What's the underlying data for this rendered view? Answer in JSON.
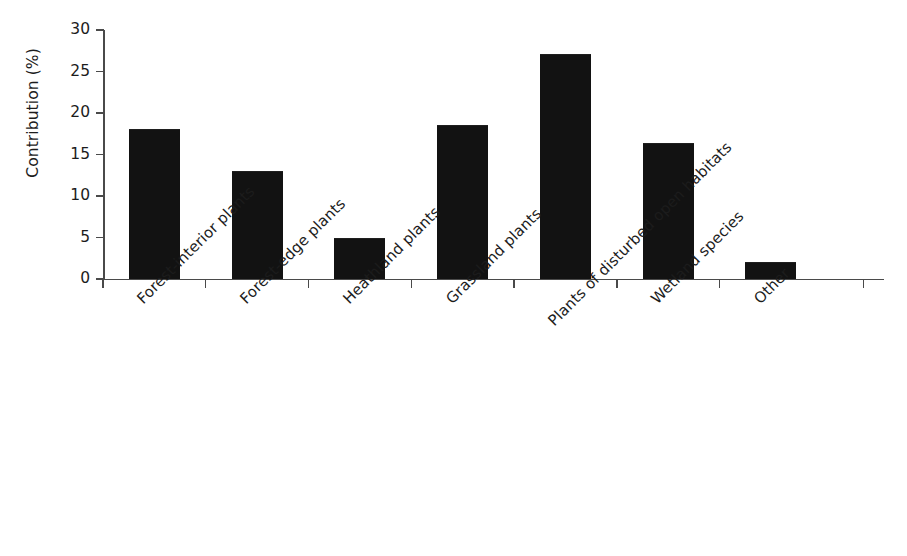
{
  "chart_data": {
    "type": "bar",
    "title": "",
    "xlabel": "",
    "ylabel": "Contribution (%)",
    "ylim": [
      0,
      30
    ],
    "yticks": [
      0,
      5,
      10,
      15,
      20,
      25,
      30
    ],
    "grid": false,
    "legend": "none",
    "bar_color": "#121212",
    "axis_color": "#4a4a4a",
    "categories": [
      "Forest-interior plants",
      "Forest-edge plants",
      "Heathland plants",
      "Grassland plants",
      "Plants of disturbed open habitats",
      "Wetland species",
      "Other"
    ],
    "values": [
      18.1,
      13.0,
      4.9,
      18.6,
      27.1,
      16.4,
      2.0
    ]
  }
}
